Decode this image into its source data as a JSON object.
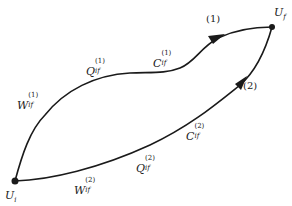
{
  "diagram": {
    "type": "thermodynamic-path-diagram",
    "colors": {
      "stroke": "#1a1a1a",
      "text": "#222222",
      "background": "#ffffff"
    },
    "nodes": {
      "initial": {
        "symbol": "U",
        "subscript": "i",
        "x": 15,
        "y": 181
      },
      "final": {
        "symbol": "U",
        "subscript": "f",
        "x": 272,
        "y": 27
      }
    },
    "paths": [
      {
        "id": "1",
        "tag": "(1)",
        "labels": [
          {
            "symbol": "W",
            "sup": "(1)",
            "sub": "if"
          },
          {
            "symbol": "Q",
            "sup": "(1)",
            "sub": "if"
          },
          {
            "symbol": "C",
            "sup": "(1)",
            "sub": "if"
          }
        ]
      },
      {
        "id": "2",
        "tag": "(2)",
        "labels": [
          {
            "symbol": "W",
            "sup": "(2)",
            "sub": "if"
          },
          {
            "symbol": "Q",
            "sup": "(2)",
            "sub": "if"
          },
          {
            "symbol": "C",
            "sup": "(2)",
            "sub": "if"
          }
        ]
      }
    ]
  }
}
